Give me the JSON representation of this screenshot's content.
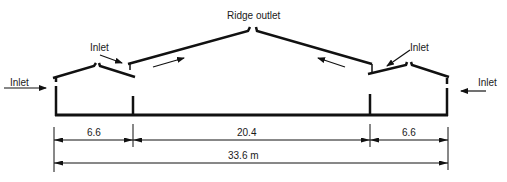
{
  "diagram": {
    "type": "building-cross-section-ventilation",
    "labels": {
      "ridge_outlet": "Ridge outlet",
      "inlet_left_wall": "Inlet",
      "inlet_left_roof": "Inlet",
      "inlet_right_roof": "Inlet",
      "inlet_right_wall": "Inlet"
    },
    "dimensions": {
      "left_span": "6.6",
      "center_span": "20.4",
      "right_span": "6.6",
      "total_span": "33.6 m"
    },
    "colors": {
      "line": "#111111",
      "text": "#1a1a1a",
      "background": "#ffffff"
    }
  }
}
